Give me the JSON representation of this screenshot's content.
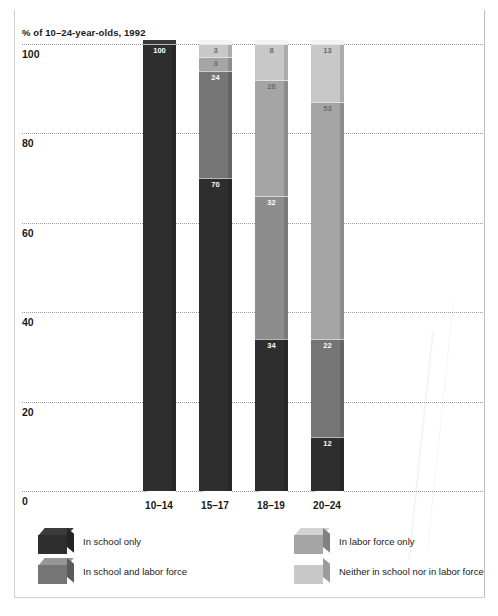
{
  "chart_data": {
    "type": "bar",
    "subtype": "stacked-column",
    "title": "% of 10–24-year-olds, 1992",
    "xlabel": "",
    "ylabel": "",
    "ylim": [
      0,
      100
    ],
    "yticks": [
      0,
      20,
      40,
      60,
      80,
      100
    ],
    "ytick_labels": [
      "0",
      "20",
      "40",
      "60",
      "80",
      "100"
    ],
    "grid": true,
    "legend_position": "bottom",
    "categories": [
      "10–14",
      "15–17",
      "18–19",
      "20–24"
    ],
    "series": [
      {
        "name": "In school only",
        "color": "#2e2e2e",
        "values": [
          100,
          70,
          34,
          12
        ]
      },
      {
        "name": "In school and labor force",
        "color": "#757575",
        "values": [
          0,
          24,
          32,
          22
        ]
      },
      {
        "name": "In labor force only",
        "color": "#a5a5a5",
        "values": [
          0,
          3,
          26,
          53
        ]
      },
      {
        "name": "Neither in school nor in labor force",
        "color": "#c8c8c8",
        "values": [
          0,
          3,
          8,
          13
        ]
      }
    ],
    "bars": [
      {
        "category": "10–14",
        "segments": [
          {
            "label": "In school only",
            "value": 100,
            "display": "100",
            "color": "#2e2e2e",
            "dark": true
          }
        ]
      },
      {
        "category": "15–17",
        "segments": [
          {
            "label": "Neither in school nor in labor force",
            "value": 3,
            "display": "3",
            "color": "#c8c8c8",
            "dark": false
          },
          {
            "label": "In labor force only",
            "value": 3,
            "display": "3",
            "color": "#a5a5a5",
            "dark": false
          },
          {
            "label": "In school and labor force",
            "value": 24,
            "display": "24",
            "color": "#757575",
            "dark": true
          },
          {
            "label": "In school only",
            "value": 70,
            "display": "70",
            "color": "#2e2e2e",
            "dark": true
          }
        ]
      },
      {
        "category": "18–19",
        "segments": [
          {
            "label": "Neither in school nor in labor force",
            "value": 8,
            "display": "8",
            "color": "#c8c8c8",
            "dark": false
          },
          {
            "label": "In labor force only",
            "value": 26,
            "display": "26",
            "color": "#a5a5a5",
            "dark": false
          },
          {
            "label": "In school and labor force",
            "value": 32,
            "display": "32",
            "color": "#8d8d8d",
            "dark": true
          },
          {
            "label": "In school only",
            "value": 34,
            "display": "34",
            "color": "#2e2e2e",
            "dark": true
          }
        ]
      },
      {
        "category": "20–24",
        "segments": [
          {
            "label": "Neither in school nor in labor force",
            "value": 13,
            "display": "13",
            "color": "#c8c8c8",
            "dark": false
          },
          {
            "label": "In labor force only",
            "value": 53,
            "display": "53",
            "color": "#a5a5a5",
            "dark": false
          },
          {
            "label": "In school and labor force",
            "value": 22,
            "display": "22",
            "color": "#757575",
            "dark": true
          },
          {
            "label": "In school only",
            "value": 12,
            "display": "12",
            "color": "#2e2e2e",
            "dark": true
          }
        ]
      }
    ]
  },
  "legend": {
    "items": [
      {
        "label": "In school only",
        "color": "#2e2e2e",
        "swatch": "cube-swatch"
      },
      {
        "label": "In labor force only",
        "color": "#a5a5a5",
        "swatch": "cube-swatch"
      },
      {
        "label": "In school and labor force",
        "color": "#757575",
        "swatch": "cube-swatch"
      },
      {
        "label": "Neither in school nor in labor force",
        "color": "#c8c8c8",
        "swatch": "cube-swatch"
      }
    ]
  }
}
